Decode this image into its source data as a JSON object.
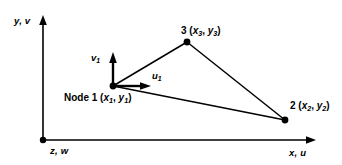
{
  "figure": {
    "type": "engineering-diagram",
    "width": 342,
    "height": 165,
    "background_color": "#ffffff",
    "stroke_color": "#000000"
  },
  "axes": {
    "vertical": {
      "label": "y, v",
      "name": "y-axis",
      "origin_px": [
        43,
        140
      ],
      "tip_px": [
        43,
        16
      ],
      "arrow": "up"
    },
    "horizontal": {
      "label": "x, u",
      "name": "x-axis",
      "origin_px": [
        43,
        140
      ],
      "tip_px": [
        315,
        140
      ],
      "arrow": "right"
    },
    "out_of_plane": {
      "label": "z, w",
      "name": "z-axis",
      "origin_px": [
        43,
        140
      ],
      "marker": "dot"
    }
  },
  "element": {
    "shape": "triangle",
    "nodes": [
      {
        "id": "1",
        "label": "Node 1 (x1, y1)",
        "number": "Node 1",
        "coord_text": "(x₁, y₁)",
        "x_var": "x",
        "y_var": "y",
        "subscript": "1",
        "px": [
          113,
          86
        ]
      },
      {
        "id": "2",
        "label": "2 (x2, y2)",
        "number": "2",
        "coord_text": "(x₂, y₂)",
        "x_var": "x",
        "y_var": "y",
        "subscript": "2",
        "px": [
          285,
          120
        ]
      },
      {
        "id": "3",
        "label": "3 (x3, y3)",
        "number": "3",
        "coord_text": "(x₃, y₃)",
        "x_var": "x",
        "y_var": "y",
        "subscript": "3",
        "px": [
          187,
          42
        ]
      }
    ],
    "edges": [
      [
        "1",
        "3"
      ],
      [
        "3",
        "2"
      ],
      [
        "2",
        "1"
      ]
    ]
  },
  "vectors": [
    {
      "name": "v1",
      "label": "v",
      "subscript": "1",
      "direction": "up",
      "from_px": [
        113,
        86
      ],
      "to_px": [
        113,
        55
      ]
    },
    {
      "name": "u1",
      "label": "u",
      "subscript": "1",
      "direction": "right",
      "from_px": [
        113,
        86
      ],
      "to_px": [
        150,
        86
      ]
    }
  ]
}
